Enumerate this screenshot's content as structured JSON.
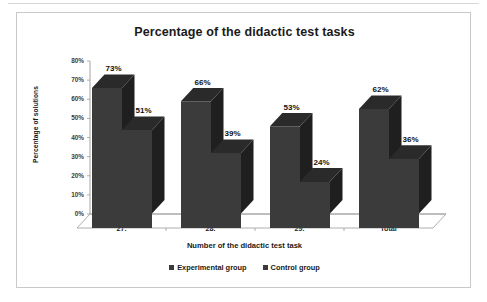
{
  "chart_data": {
    "type": "bar",
    "title": "Percentage of the didactic test tasks",
    "xlabel": "Number of the didactic  test task",
    "ylabel": "Percentage of solutions",
    "categories": [
      "27.",
      "28.",
      "29.",
      "Total"
    ],
    "series": [
      {
        "name": "Experimental group",
        "values": [
          73,
          66,
          53,
          62
        ],
        "color": "#3b3b3b"
      },
      {
        "name": "Control group",
        "values": [
          51,
          39,
          24,
          36
        ],
        "color": "#3b3b3b"
      }
    ],
    "value_labels": [
      [
        "73%",
        "51%"
      ],
      [
        "66%",
        "39%"
      ],
      [
        "53%",
        "24%"
      ],
      [
        "62%",
        "36%"
      ]
    ],
    "ylim": [
      0,
      80
    ],
    "yticks": [
      0,
      10,
      20,
      30,
      40,
      50,
      60,
      70,
      80
    ],
    "ytick_labels": [
      "0%",
      "10%",
      "20%",
      "30%",
      "40%",
      "50%",
      "60%",
      "70%",
      "80%"
    ],
    "grid": false,
    "legend_position": "bottom",
    "three_d": true
  },
  "legend": {
    "items": [
      {
        "label": "Experimental group",
        "marker": "square-marker"
      },
      {
        "label": "Control group",
        "marker": "square-marker"
      }
    ]
  },
  "colors": {
    "bar_front": "#3b3b3b",
    "bar_side": "#1f1f1f",
    "bar_top": "#2a2a2a",
    "frame_border": "#c9c9c9",
    "axis_line": "#9a9a9a",
    "text": "#1a1a1a"
  }
}
